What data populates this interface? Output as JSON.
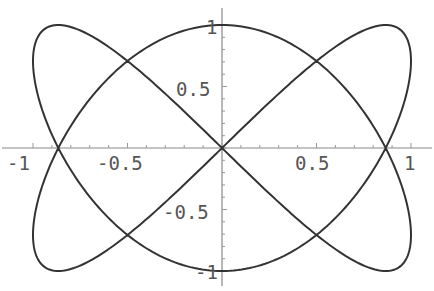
{
  "chart_data": {
    "type": "line",
    "title": "",
    "xlabel": "",
    "ylabel": "",
    "parametric": {
      "x": "sin(2t)",
      "y": "cos(3t)",
      "t_range": [
        0,
        6.2832
      ]
    },
    "series": [
      {
        "name": "curve",
        "key_points": [
          {
            "x": 0,
            "y": 1
          },
          {
            "x": 0.866,
            "y": 0
          },
          {
            "x": 1,
            "y": -0.707
          },
          {
            "x": 0.866,
            "y": -1
          },
          {
            "x": 0,
            "y": 0
          },
          {
            "x": -0.866,
            "y": 1
          },
          {
            "x": -1,
            "y": 0.707
          },
          {
            "x": -0.866,
            "y": 0
          },
          {
            "x": 0,
            "y": -1
          },
          {
            "x": 0.866,
            "y": 1
          },
          {
            "x": 1,
            "y": 0.707
          }
        ]
      }
    ],
    "xlim": [
      -1,
      1
    ],
    "ylim": [
      -1,
      1
    ],
    "x_ticks": [
      "-1",
      "-0.5",
      "0.5",
      "1"
    ],
    "y_ticks": [
      "1",
      "0.5",
      "-0.5",
      "-1"
    ],
    "grid": false,
    "legend": "none",
    "line_color": "#333333",
    "axis_color": "#888888"
  },
  "axes": {
    "x_tick_labels": [
      "-1",
      "-0.5",
      "0.5",
      "1"
    ],
    "y_tick_labels": [
      "1",
      "0.5",
      "-0.5",
      "-1"
    ]
  }
}
